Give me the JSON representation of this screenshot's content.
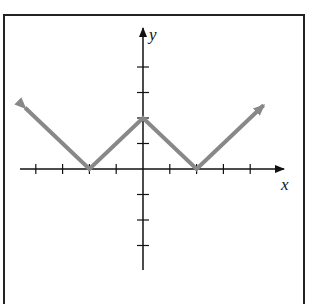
{
  "chart_data": {
    "type": "line",
    "title": "",
    "xlabel": "x",
    "ylabel": "y",
    "xlim": [
      -4,
      4
    ],
    "ylim": [
      -3,
      5
    ],
    "grid": false,
    "x_ticks": [
      -4,
      -3,
      -2,
      -1,
      1,
      2,
      3,
      4
    ],
    "y_ticks": [
      -3,
      -2,
      -1,
      1,
      2,
      3,
      4
    ],
    "series": [
      {
        "name": "W-shaped piecewise linear graph",
        "color": "#888888",
        "x": [
          -4.4,
          -2,
          0,
          2,
          4.5
        ],
        "y": [
          2.4,
          0,
          2,
          0,
          2.5
        ],
        "arrows": [
          "start",
          "end"
        ]
      }
    ],
    "vertices": [
      [
        -2,
        0
      ],
      [
        0,
        2
      ],
      [
        2,
        0
      ]
    ]
  },
  "labels": {
    "x_axis": "x",
    "y_axis": "y"
  }
}
